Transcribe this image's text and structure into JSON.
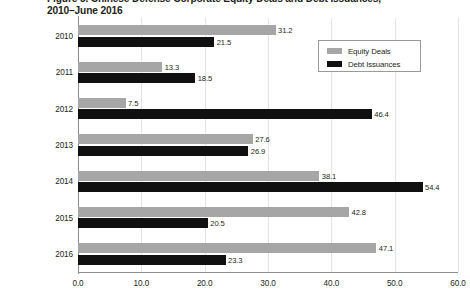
{
  "chart_data": {
    "type": "bar",
    "orientation": "horizontal",
    "title": "Figure 5. Chinese Defense Corporate Equity Deals and Debt Issuances, 2010–June 2016",
    "title_line1": "Figure 5. Chinese Defense Corporate Equity Deals and Debt Issuances,",
    "title_line2": "2010–June 2016",
    "categories": [
      "2010",
      "2011",
      "2012",
      "2013",
      "2014",
      "2015",
      "2016"
    ],
    "series": [
      {
        "name": "Equity Deals",
        "color": "#a6a6a6",
        "values": [
          31.2,
          13.3,
          7.5,
          27.6,
          38.1,
          42.8,
          47.1
        ],
        "labels": [
          "31.2",
          "13.3",
          "7.5",
          "27.6",
          "38.1",
          "42.8",
          "47.1"
        ]
      },
      {
        "name": "Debt Issuances",
        "color": "#101010",
        "values": [
          21.5,
          18.5,
          46.4,
          26.9,
          54.4,
          20.5,
          23.3
        ],
        "labels": [
          "21.5",
          "18.5",
          "46.4",
          "26.9",
          "54.4",
          "20.5",
          "23.3"
        ]
      }
    ],
    "xlabel": "",
    "ylabel": "",
    "xlim": [
      0.0,
      60.0
    ],
    "xticks": [
      0.0,
      10.0,
      20.0,
      30.0,
      40.0,
      50.0,
      60.0
    ],
    "xtick_labels": [
      "0.0",
      "10.0",
      "20.0",
      "30.0",
      "40.0",
      "50.0",
      "60.0"
    ],
    "grid": true,
    "grid_axis": "x",
    "legend_position": "top-right",
    "legend_entries": [
      "Equity Deals",
      "Debt Issuances"
    ]
  }
}
